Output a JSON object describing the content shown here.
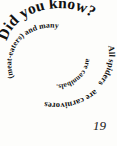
{
  "page": {
    "background_color": "#fdfdfb",
    "text_color": "#111111",
    "page_number": "19"
  },
  "spiral": {
    "headline": "Did you know?",
    "full_text": "Did you know? All spiders are carnivores (meat-eaters) and many are cannibals.",
    "segments": [
      {
        "id": "headline",
        "text": "Did you know?"
      },
      {
        "id": "segment-1",
        "text": "All spiders"
      },
      {
        "id": "segment-2",
        "text": "are carnivores"
      },
      {
        "id": "segment-3",
        "text": "(meat-eaters) and many"
      },
      {
        "id": "segment-4",
        "text": "are cannibals."
      }
    ]
  }
}
